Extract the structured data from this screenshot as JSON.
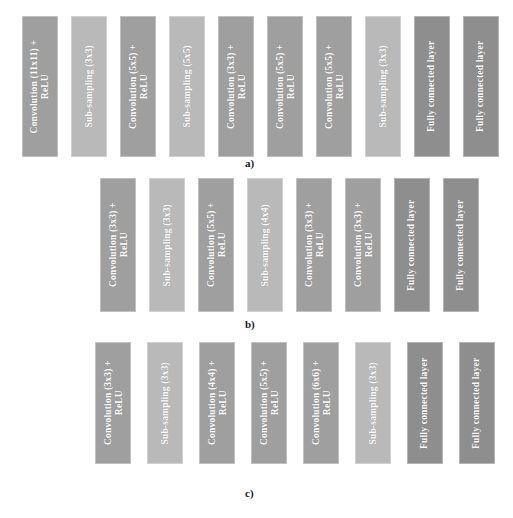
{
  "figure": {
    "background_color": "#ffffff",
    "colors": {
      "convolution": "#9f9f9f",
      "subsampling": "#b9b9b9",
      "fully_connected": "#8e8e8e",
      "text": "#ffffff",
      "caption": "#1a1a1a"
    }
  },
  "rows": [
    {
      "caption": "a)",
      "caption_x": 245,
      "caption_y": 157,
      "left": 22,
      "top": 16,
      "block_height": 141,
      "block_width": 36,
      "gap": 13,
      "font_size": 9.5,
      "blocks": [
        {
          "type": "convolution",
          "line1": "Convolution   (11x11) +",
          "line2": "ReLU"
        },
        {
          "type": "subsampling",
          "line1": "Sub-sampling (3x3)",
          "line2": ""
        },
        {
          "type": "convolution",
          "line1": "Convolution    (5x5) +",
          "line2": "ReLU"
        },
        {
          "type": "subsampling",
          "line1": "Sub-sampling (5x5)",
          "line2": ""
        },
        {
          "type": "convolution",
          "line1": "Convolution    (3x3) +",
          "line2": "ReLU"
        },
        {
          "type": "convolution",
          "line1": "Convolution    (5x5) +",
          "line2": "ReLU"
        },
        {
          "type": "convolution",
          "line1": "Convolution    (5x5) +",
          "line2": "ReLU"
        },
        {
          "type": "subsampling",
          "line1": "Sub-sampling (3x3)",
          "line2": ""
        },
        {
          "type": "fully_connected",
          "line1": "Fully connected layer",
          "line2": ""
        },
        {
          "type": "fully_connected",
          "line1": "Fully connected layer",
          "line2": ""
        }
      ]
    },
    {
      "caption": "b)",
      "caption_x": 245,
      "caption_y": 318,
      "left": 100,
      "top": 178,
      "block_height": 134,
      "block_width": 36,
      "gap": 13,
      "font_size": 9.5,
      "blocks": [
        {
          "type": "convolution",
          "line1": "Convolution    (3x3) +",
          "line2": "ReLU"
        },
        {
          "type": "subsampling",
          "line1": "Sub-sampling (3x3)",
          "line2": ""
        },
        {
          "type": "convolution",
          "line1": "Convolution    (5x5) +",
          "line2": "ReLU"
        },
        {
          "type": "subsampling",
          "line1": "Sub-sampling (4x4)",
          "line2": ""
        },
        {
          "type": "convolution",
          "line1": "Convolution    (3x3) +",
          "line2": "ReLU"
        },
        {
          "type": "convolution",
          "line1": "Convolution    (3x3) +",
          "line2": "ReLU"
        },
        {
          "type": "fully_connected",
          "line1": "Fully connected layer",
          "line2": ""
        },
        {
          "type": "fully_connected",
          "line1": "Fully connected layer",
          "line2": ""
        }
      ]
    },
    {
      "caption": "c)",
      "caption_x": 245,
      "caption_y": 487,
      "left": 95,
      "top": 342,
      "block_height": 122,
      "block_width": 36,
      "gap": 16,
      "font_size": 9.5,
      "blocks": [
        {
          "type": "convolution",
          "line1": "Convolution    (3x3) +",
          "line2": "ReLU"
        },
        {
          "type": "subsampling",
          "line1": "Sub-sampling (3x3)",
          "line2": ""
        },
        {
          "type": "convolution",
          "line1": "Convolution    (4x4) +",
          "line2": "ReLU"
        },
        {
          "type": "convolution",
          "line1": "Convolution    (5x5) +",
          "line2": "ReLU"
        },
        {
          "type": "convolution",
          "line1": "Convolution    (6x6) +",
          "line2": "ReLU"
        },
        {
          "type": "subsampling",
          "line1": "Sub-sampling (3x3)",
          "line2": ""
        },
        {
          "type": "fully_connected",
          "line1": "Fully connected layer",
          "line2": ""
        },
        {
          "type": "fully_connected",
          "line1": "Fully connected layer",
          "line2": ""
        }
      ]
    }
  ]
}
